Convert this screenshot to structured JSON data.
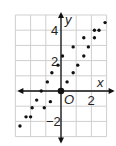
{
  "chart_data": {
    "type": "scatter",
    "title": "",
    "xlabel": "x",
    "ylabel": "y",
    "origin_label": "O",
    "xlim": [
      -3,
      3
    ],
    "ylim": [
      -3,
      5
    ],
    "grid": true,
    "x_tick_labels": [
      {
        "value": 2,
        "label": "2"
      }
    ],
    "y_tick_labels": [
      {
        "value": 4,
        "label": "4"
      },
      {
        "value": 2,
        "label": "2"
      },
      {
        "value": -2,
        "label": "−2"
      }
    ],
    "series": [
      {
        "name": "points",
        "points": [
          [
            2.9,
            4.5
          ],
          [
            2.2,
            4.0
          ],
          [
            2.5,
            4.0
          ],
          [
            1.5,
            3.5
          ],
          [
            2.2,
            3.5
          ],
          [
            0.8,
            2.9
          ],
          [
            1.8,
            2.9
          ],
          [
            1.5,
            2.3
          ],
          [
            0.1,
            2.3
          ],
          [
            -0.2,
            1.7
          ],
          [
            1.1,
            1.7
          ],
          [
            -0.6,
            1.2
          ],
          [
            0.8,
            1.2
          ],
          [
            -0.9,
            0.6
          ],
          [
            0.4,
            0.6
          ],
          [
            -1.3,
            0.0
          ],
          [
            -1.6,
            -0.6
          ],
          [
            -0.7,
            -0.7
          ],
          [
            -1.9,
            -1.1
          ],
          [
            -1.1,
            -1.1
          ],
          [
            -2.3,
            -1.7
          ],
          [
            -2.0,
            -1.7
          ],
          [
            -2.7,
            -2.3
          ]
        ]
      }
    ],
    "origin_point": [
      0,
      0
    ],
    "colors": {
      "grid": "#cfcfcf",
      "axis": "#111111",
      "point": "#111111"
    }
  }
}
